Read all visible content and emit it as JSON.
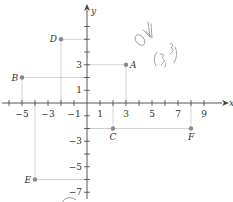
{
  "chart_data": {
    "type": "scatter",
    "title": "",
    "xlabel": "x",
    "ylabel": "y",
    "xlim": [
      -6,
      10
    ],
    "ylim": [
      -8,
      7
    ],
    "grid": false,
    "x_tick_labels": [
      "-5",
      "-3",
      "-1",
      "1",
      "3",
      "5",
      "7",
      "9"
    ],
    "x_tick_values": [
      -5,
      -3,
      -1,
      1,
      3,
      5,
      7,
      9
    ],
    "y_tick_labels": [
      "3",
      "1",
      "-3",
      "-5",
      "-7"
    ],
    "y_tick_values": [
      3,
      1,
      -3,
      -5,
      -7
    ],
    "points": [
      {
        "label": "A",
        "x": 3,
        "y": 3
      },
      {
        "label": "B",
        "x": -5,
        "y": 2
      },
      {
        "label": "C",
        "x": 2,
        "y": -2
      },
      {
        "label": "D",
        "x": -2,
        "y": 5
      },
      {
        "label": "E",
        "x": -4,
        "y": -6
      },
      {
        "label": "F",
        "x": 8,
        "y": -2
      }
    ],
    "annotations": [
      "handwritten \"ok\" mark",
      "handwritten \"(3,3)\""
    ]
  },
  "colors": {
    "axis": "#444444",
    "point": "#8a8a8a",
    "guide": "#c8c8c8",
    "text": "#333333",
    "handwriting": "#9a9a9a"
  },
  "handwriting": {
    "check": "ok",
    "coord": "(3,3)"
  }
}
